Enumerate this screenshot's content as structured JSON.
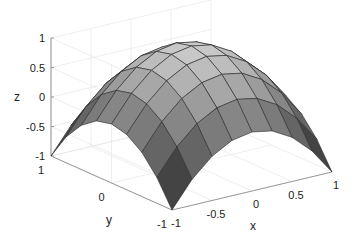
{
  "chart_data": {
    "type": "surface3d",
    "title": "",
    "function": "z = 1 - x^2 - y^2",
    "xlabel": "x",
    "ylabel": "y",
    "zlabel": "z",
    "xlim": [
      -1,
      1
    ],
    "ylim": [
      -1,
      1
    ],
    "zlim": [
      -1,
      1
    ],
    "x": [
      -1,
      -0.75,
      -0.5,
      -0.25,
      0,
      0.25,
      0.5,
      0.75,
      1
    ],
    "y": [
      -1,
      -0.75,
      -0.5,
      -0.25,
      0,
      0.25,
      0.5,
      0.75,
      1
    ],
    "x_ticks": [
      "-1",
      "-0.5",
      "0",
      "0.5",
      "1"
    ],
    "y_ticks": [
      "-1",
      "0",
      "1"
    ],
    "z_ticks": [
      "-1",
      "-0.5",
      "0",
      "0.5",
      "1"
    ],
    "colormap": "gray",
    "grid": true,
    "legend": null
  },
  "projection": {
    "origin_px": [
      172,
      210
    ],
    "x_unit_px": [
      80,
      -19
    ],
    "y_unit_px": [
      -60.5,
      -27
    ],
    "z_unit_px": [
      0,
      -59
    ],
    "z_axis_x": 51
  },
  "colors": {
    "edge": "#2a2a2a",
    "axis": "#999999",
    "grid": "#e6e6e6",
    "text": "#222222",
    "background": "#ffffff"
  }
}
